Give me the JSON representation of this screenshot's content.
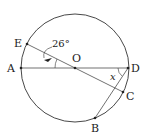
{
  "diagram": {
    "type": "circle-geometry",
    "points": {
      "A": {
        "label": "A",
        "x": 21,
        "y": 68
      },
      "D": {
        "label": "D",
        "x": 128,
        "y": 68
      },
      "O": {
        "label": "O",
        "x": 75,
        "y": 68
      },
      "E": {
        "label": "E",
        "x": 27,
        "y": 44
      },
      "C": {
        "label": "C",
        "x": 123,
        "y": 92
      },
      "B": {
        "label": "B",
        "x": 95,
        "y": 118
      }
    },
    "angle_label": "26°",
    "unknown_label": "x",
    "colors": {
      "stroke": "#333333",
      "background": "#ffffff"
    }
  }
}
